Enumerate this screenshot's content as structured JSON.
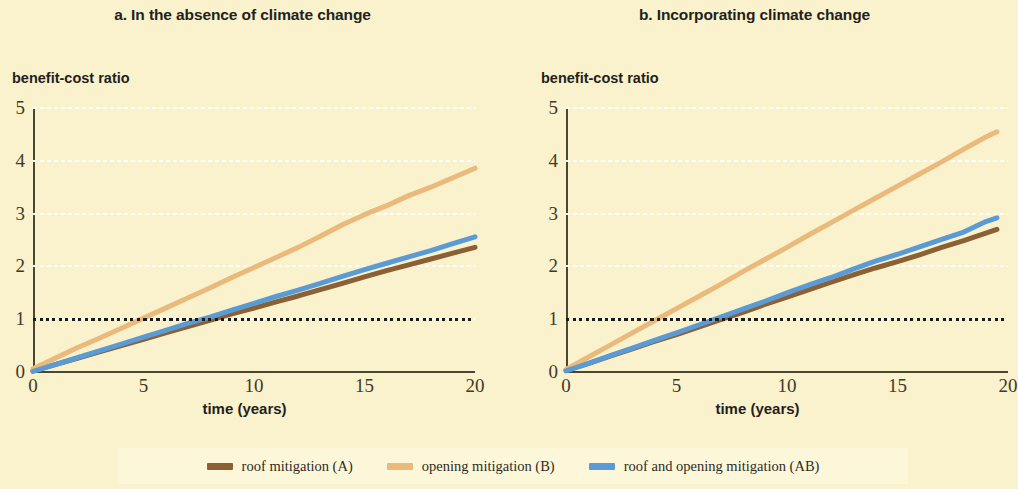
{
  "figure": {
    "background_color": "#faf2cc",
    "panels": [
      {
        "id": "a",
        "title": "a. In the absence of climate change",
        "ylabel": "benefit-cost ratio",
        "xlabel": "time (years)"
      },
      {
        "id": "b",
        "title": "b. Incorporating climate change",
        "ylabel": "benefit-cost ratio",
        "xlabel": "time (years)"
      }
    ]
  },
  "legend": {
    "position": "bottom",
    "items": [
      {
        "label": "roof mitigation (A)",
        "color": "#8a6034",
        "key": "roof"
      },
      {
        "label": "opening mitigation (B)",
        "color": "#eab97c",
        "key": "opening"
      },
      {
        "label": "roof and opening mitigation (AB)",
        "color": "#5b9bd5",
        "key": "roof_and_opening"
      }
    ]
  },
  "axes": {
    "y_ticks": [
      "0",
      "1",
      "2",
      "3",
      "4",
      "5"
    ],
    "x_ticks": [
      "0",
      "5",
      "10",
      "15",
      "20"
    ],
    "ylim": [
      0,
      5
    ],
    "xlim": [
      0,
      20
    ],
    "threshold_value": 1
  },
  "chart_data": [
    {
      "type": "line",
      "title": "a. In the absence of climate change",
      "xlabel": "time (years)",
      "ylabel": "benefit-cost ratio",
      "xlim": [
        0,
        20
      ],
      "ylim": [
        0,
        5
      ],
      "xticks": [
        0,
        5,
        10,
        15,
        20
      ],
      "yticks": [
        0,
        1,
        2,
        3,
        4,
        5
      ],
      "grid": "horizontal-dotted-white",
      "annotations": [
        {
          "type": "hline",
          "y": 1,
          "style": "dotted",
          "color": "#1a1a1a"
        }
      ],
      "legend_position": "below-figure-shared",
      "x": [
        0,
        1,
        2,
        3,
        4,
        5,
        6,
        7,
        8,
        9,
        10,
        11,
        12,
        13,
        14,
        15,
        16,
        17,
        18,
        19,
        20
      ],
      "series": [
        {
          "name": "roof mitigation (A)",
          "color": "#8a6034",
          "values": [
            0.02,
            0.14,
            0.26,
            0.38,
            0.5,
            0.62,
            0.74,
            0.86,
            0.98,
            1.1,
            1.21,
            1.33,
            1.44,
            1.56,
            1.68,
            1.8,
            1.92,
            2.03,
            2.14,
            2.25,
            2.36
          ]
        },
        {
          "name": "opening mitigation (B)",
          "color": "#eab97c",
          "values": [
            0.06,
            0.26,
            0.46,
            0.64,
            0.83,
            1.02,
            1.21,
            1.4,
            1.59,
            1.79,
            1.98,
            2.17,
            2.36,
            2.57,
            2.79,
            2.98,
            3.15,
            3.34,
            3.5,
            3.68,
            3.86
          ]
        },
        {
          "name": "roof and opening mitigation (AB)",
          "color": "#5b9bd5",
          "values": [
            0.01,
            0.14,
            0.27,
            0.4,
            0.53,
            0.66,
            0.79,
            0.92,
            1.04,
            1.17,
            1.3,
            1.43,
            1.55,
            1.68,
            1.81,
            1.94,
            2.06,
            2.18,
            2.3,
            2.43,
            2.56
          ]
        }
      ]
    },
    {
      "type": "line",
      "title": "b. Incorporating climate change",
      "xlabel": "time (years)",
      "ylabel": "benefit-cost ratio",
      "xlim": [
        0,
        20
      ],
      "ylim": [
        0,
        5
      ],
      "xticks": [
        0,
        5,
        10,
        15,
        20
      ],
      "yticks": [
        0,
        1,
        2,
        3,
        4,
        5
      ],
      "grid": "horizontal-dotted-white",
      "annotations": [
        {
          "type": "hline",
          "y": 1,
          "style": "dotted",
          "color": "#1a1a1a"
        }
      ],
      "legend_position": "below-figure-shared",
      "x": [
        0,
        1,
        2,
        3,
        4,
        5,
        6,
        7,
        8,
        9,
        10,
        11,
        12,
        13,
        14,
        15,
        16,
        17,
        18,
        19,
        19.5
      ],
      "series": [
        {
          "name": "roof mitigation (A)",
          "color": "#8a6034",
          "values": [
            0.03,
            0.16,
            0.3,
            0.44,
            0.58,
            0.71,
            0.85,
            0.99,
            1.13,
            1.28,
            1.42,
            1.56,
            1.7,
            1.84,
            1.97,
            2.09,
            2.22,
            2.36,
            2.49,
            2.63,
            2.7
          ]
        },
        {
          "name": "opening mitigation (B)",
          "color": "#eab97c",
          "values": [
            0.05,
            0.28,
            0.51,
            0.74,
            0.97,
            1.2,
            1.43,
            1.66,
            1.9,
            2.13,
            2.36,
            2.6,
            2.83,
            3.06,
            3.29,
            3.52,
            3.75,
            3.98,
            4.22,
            4.45,
            4.55
          ]
        },
        {
          "name": "roof and opening mitigation (AB)",
          "color": "#5b9bd5",
          "values": [
            0.02,
            0.16,
            0.31,
            0.45,
            0.6,
            0.74,
            0.89,
            1.04,
            1.19,
            1.34,
            1.5,
            1.65,
            1.79,
            1.95,
            2.1,
            2.23,
            2.37,
            2.51,
            2.65,
            2.85,
            2.92
          ]
        }
      ]
    }
  ]
}
